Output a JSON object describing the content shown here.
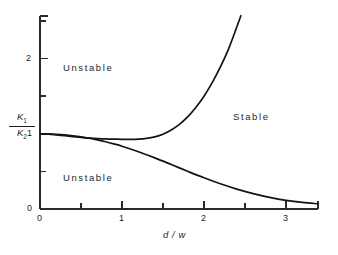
{
  "figure": {
    "background_color": "#ffffff",
    "line_color": "#141414",
    "axis_color": "#2b2b2b",
    "text_color": "#1f1f1f"
  },
  "axes": {
    "y_label_numerator": "K",
    "y_label_numerator_sub": "1",
    "y_label_denominator": "K",
    "y_label_denominator_sub": "2",
    "x_label": "d / w",
    "x_tick_labels": [
      "0",
      "1",
      "2",
      "3"
    ],
    "y_tick_labels": [
      "0",
      "1",
      "2"
    ],
    "x_origin_label": "0"
  },
  "regions": {
    "upper_left": "Unstable",
    "lower_left": "Unstable",
    "right": "Stable"
  },
  "chart_data": {
    "type": "line",
    "title": "",
    "subtitle": "",
    "xlabel": "d / w",
    "ylabel": "K1/K2",
    "xlim": [
      0,
      3.39
    ],
    "ylim": [
      0,
      2.57
    ],
    "grid": false,
    "legend": null,
    "x_ticks_major": [
      0,
      1,
      2,
      3
    ],
    "x_ticks_minor": [
      0.5,
      1.5,
      2.5,
      3.5
    ],
    "y_ticks_major": [
      0,
      1,
      2
    ],
    "y_ticks_minor": [
      0.5,
      1.5,
      2.5
    ],
    "annotations": [
      {
        "text": "Unstable",
        "x": 0.75,
        "y": 1.93,
        "region": "upper-left"
      },
      {
        "text": "Unstable",
        "x": 0.75,
        "y": 0.47,
        "region": "lower-left"
      },
      {
        "text": "Stable",
        "x": 2.62,
        "y": 1.28,
        "region": "right"
      }
    ],
    "series": [
      {
        "name": "upper stability boundary",
        "description": "Dips to a shallow minimum near d/w = 1.2 then rises steeply, exiting the top of the frame at d/w = 2.45",
        "x": [
          0.0,
          0.1,
          0.2,
          0.3,
          0.4,
          0.5,
          0.6,
          0.7,
          0.8,
          0.9,
          1.0,
          1.1,
          1.2,
          1.3,
          1.4,
          1.5,
          1.6,
          1.7,
          1.8,
          1.9,
          2.0,
          2.1,
          2.2,
          2.3,
          2.4,
          2.45
        ],
        "y": [
          1.0,
          0.995,
          0.985,
          0.974,
          0.963,
          0.953,
          0.944,
          0.937,
          0.932,
          0.929,
          0.927,
          0.927,
          0.93,
          0.94,
          0.96,
          0.995,
          1.05,
          1.125,
          1.225,
          1.35,
          1.5,
          1.68,
          1.89,
          2.13,
          2.42,
          2.57
        ]
      },
      {
        "name": "lower stability boundary",
        "description": "Monotonically decreasing from 1 at the origin, flattening toward 0.07 at the right edge",
        "x": [
          0.0,
          0.1,
          0.2,
          0.3,
          0.4,
          0.5,
          0.6,
          0.7,
          0.8,
          0.9,
          1.0,
          1.2,
          1.4,
          1.6,
          1.8,
          2.0,
          2.2,
          2.4,
          2.6,
          2.8,
          3.0,
          3.2,
          3.39
        ],
        "y": [
          1.0,
          0.998,
          0.993,
          0.985,
          0.974,
          0.96,
          0.942,
          0.92,
          0.895,
          0.866,
          0.835,
          0.762,
          0.68,
          0.592,
          0.502,
          0.415,
          0.335,
          0.265,
          0.205,
          0.155,
          0.115,
          0.087,
          0.07
        ]
      }
    ]
  }
}
